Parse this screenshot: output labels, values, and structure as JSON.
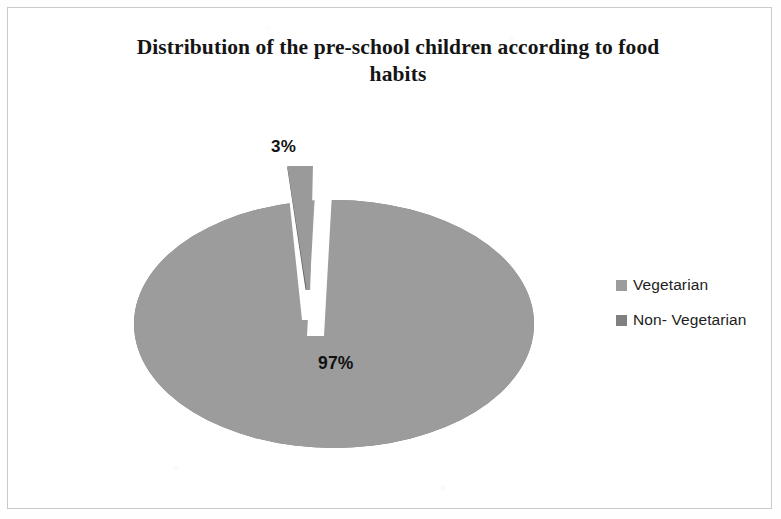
{
  "chart_data": {
    "type": "pie",
    "title": "Distribution of the pre-school children according to food habits",
    "title_line1": "Distribution of the pre-school children according to food",
    "title_line2": "habits",
    "categories": [
      "Vegetarian",
      "Non- Vegetarian"
    ],
    "values": [
      97,
      3
    ],
    "value_labels": [
      "97%",
      "3%"
    ],
    "units": "percent",
    "legend_position": "right",
    "grid": false,
    "exploded_slices": [
      "Non- Vegetarian"
    ],
    "three_d": true,
    "colors": {
      "vegetarian_top": "#9c9c9c",
      "vegetarian_side": "#7b7b7b",
      "non_vegetarian_top": "#9a9a9a",
      "non_vegetarian_side": "#5f5f5f",
      "label_text": "#111111",
      "title_text": "#151515",
      "frame_border": "#c9cacb",
      "background": "#ffffff"
    }
  },
  "chart": {
    "title_line1": "Distribution of the pre-school children according to food",
    "title_line2": "habits",
    "slice_small_label": "3%",
    "slice_large_label": "97%"
  },
  "legend": {
    "items": [
      {
        "label": "Vegetarian",
        "swatch_color": "#9c9c9c"
      },
      {
        "label": "Non- Vegetarian",
        "swatch_color": "#808080"
      }
    ]
  }
}
